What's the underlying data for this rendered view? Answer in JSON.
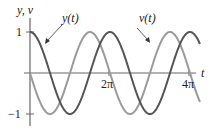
{
  "chart_data": {
    "type": "line",
    "title": "",
    "xlabel": "t",
    "ylabel": "y, v",
    "xlim": [
      0,
      13.35
    ],
    "ylim": [
      -1,
      1
    ],
    "grid": false,
    "legend": "inline annotations with arrows",
    "x_ticks": [
      {
        "value": 6.2832,
        "label": "2π"
      },
      {
        "value": 12.5664,
        "label": "4π"
      }
    ],
    "y_ticks": [
      {
        "value": 1,
        "label": "1"
      },
      {
        "value": -1,
        "label": "−1"
      }
    ],
    "series": [
      {
        "name": "y(t)",
        "function": "cos(t)",
        "color": "#555555",
        "x": [
          0,
          1.5708,
          3.1416,
          4.7124,
          6.2832,
          7.854,
          9.4248,
          10.9956,
          12.5664
        ],
        "values": [
          1,
          0,
          -1,
          0,
          1,
          0,
          -1,
          0,
          1
        ]
      },
      {
        "name": "v(t)",
        "function": "-sin(t)",
        "color": "#9a9a9a",
        "x": [
          0,
          1.5708,
          3.1416,
          4.7124,
          6.2832,
          7.854,
          9.4248,
          10.9956,
          12.5664
        ],
        "values": [
          0,
          -1,
          0,
          1,
          0,
          -1,
          0,
          1,
          0
        ]
      }
    ],
    "annotations": [
      {
        "text": "y(t)",
        "points_to": "y(t) near t≈0.9"
      },
      {
        "text": "v(t)",
        "points_to": "v(t) near t≈8.6"
      }
    ]
  },
  "labels": {
    "y_axis": "y, v",
    "x_axis": "t",
    "tick_1": "1",
    "tick_neg1": "−1",
    "tick_2pi": "2π",
    "tick_4pi": "4π",
    "ann_y": "y(t)",
    "ann_v": "v(t)"
  },
  "colors": {
    "y_curve": "#555555",
    "v_curve": "#9a9a9a",
    "axis": "#666666"
  }
}
